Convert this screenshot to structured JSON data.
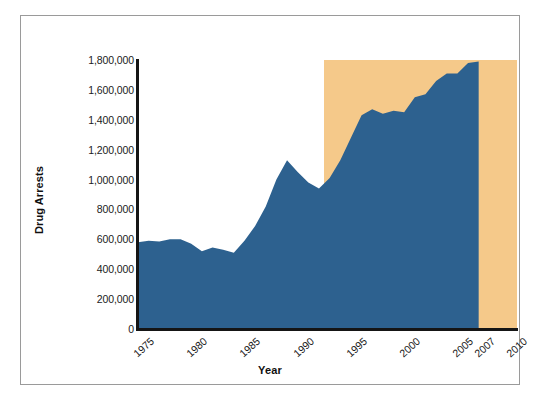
{
  "chart_data": {
    "type": "area",
    "title": "",
    "xlabel": "Year",
    "ylabel": "Drug Arrests",
    "xlim": [
      1975,
      2010.6
    ],
    "ylim": [
      0,
      1800000
    ],
    "grid": false,
    "legend": "none",
    "series_color": "#2d618f",
    "highlight_color": "#f5c98a",
    "highlight_band": {
      "label": "",
      "x_start": 1992.5,
      "x_end": 2010.6,
      "y_top": 1800000
    },
    "y_ticks": [
      0,
      200000,
      400000,
      600000,
      800000,
      1000000,
      1200000,
      1400000,
      1600000,
      1800000
    ],
    "y_tick_labels": [
      "0",
      "200,000",
      "400,000",
      "600,000",
      "800,000",
      "1,000,000",
      "1,200,000",
      "1,400,000",
      "1,600,000",
      "1,800,000"
    ],
    "x_ticks": [
      1975,
      1980,
      1985,
      1990,
      1995,
      2000,
      2005,
      2007,
      2010
    ],
    "x_tick_labels": [
      "1975",
      "1980",
      "1985",
      "1990",
      "1995",
      "2000",
      "2005",
      "2007",
      "2010"
    ],
    "x": [
      1975,
      1976,
      1977,
      1978,
      1979,
      1980,
      1981,
      1982,
      1983,
      1984,
      1985,
      1986,
      1987,
      1988,
      1989,
      1990,
      1991,
      1992,
      1993,
      1994,
      1995,
      1996,
      1997,
      1998,
      1999,
      2000,
      2001,
      2002,
      2003,
      2004,
      2005,
      2006,
      2007
    ],
    "values": [
      580000,
      590000,
      585000,
      600000,
      600000,
      570000,
      520000,
      545000,
      530000,
      510000,
      590000,
      690000,
      820000,
      1000000,
      1130000,
      1050000,
      980000,
      940000,
      1010000,
      1130000,
      1280000,
      1430000,
      1470000,
      1440000,
      1460000,
      1450000,
      1550000,
      1570000,
      1660000,
      1710000,
      1710000,
      1780000,
      1790000
    ]
  }
}
